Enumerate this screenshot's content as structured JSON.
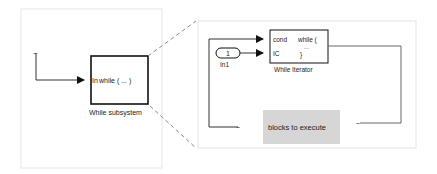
{
  "left_panel": {
    "subsystem_block": {
      "port_label": "In",
      "content": "while ( ... )",
      "caption": "While subsystem"
    }
  },
  "right_panel": {
    "inport": {
      "number": "1",
      "label": "In1"
    },
    "while_iterator": {
      "port_cond": "cond",
      "port_ic": "IC",
      "line1": "while (",
      "line2": "...",
      "line3": "}",
      "caption": "While Iterator"
    },
    "blocks_box": {
      "label": "blocks to execute",
      "fill": "#d6d6d6"
    }
  },
  "colors": {
    "panel_border": "#e4e4e4",
    "line": "#333333",
    "dashed": "#888888",
    "block_border": "#111111"
  }
}
